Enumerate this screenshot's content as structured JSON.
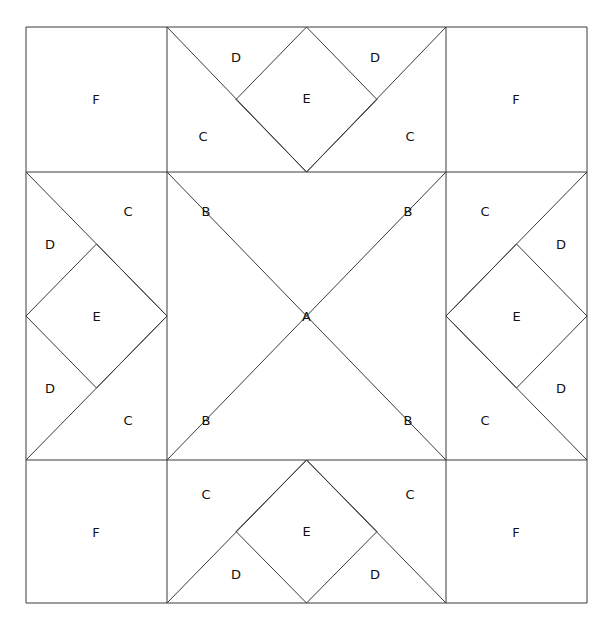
{
  "diagram": {
    "type": "quilt-block-line-diagram",
    "background_color": "#ffffff",
    "line_color": "#3a3a3a",
    "label_color": "#111111",
    "geometry": {
      "outer_left": 26,
      "outer_top": 27,
      "outer_right": 587,
      "outer_bottom": 603,
      "grid_x": [
        26,
        167,
        446,
        587
      ],
      "grid_y": [
        27,
        172,
        460,
        603
      ],
      "center_x": 306.5,
      "center_y": 316,
      "mid_top_y": 99.5,
      "mid_bottom_y": 531.5,
      "mid_left_x": 96.5,
      "mid_right_x": 516.5
    },
    "lines": [
      {
        "name": "outer-border-rect",
        "points": "26,27 587,27 587,603 26,603 26,27"
      },
      {
        "name": "grid-vertical-left",
        "points": "167,27 167,603"
      },
      {
        "name": "grid-vertical-right",
        "points": "446,27 446,603"
      },
      {
        "name": "grid-horizontal-top",
        "points": "26,172 587,172"
      },
      {
        "name": "grid-horizontal-bottom",
        "points": "26,460 587,460"
      },
      {
        "name": "center-diag-nw-se",
        "points": "167,172 446,460"
      },
      {
        "name": "center-diag-ne-sw",
        "points": "446,172 167,460"
      },
      {
        "name": "top-star-left-diag",
        "points": "167,27 306.5,172"
      },
      {
        "name": "top-star-right-diag",
        "points": "446,27 306.5,172"
      },
      {
        "name": "top-diamond-upper-left",
        "points": "236,99.5 306.5,27"
      },
      {
        "name": "top-diamond-upper-right",
        "points": "306.5,27 377,99.5"
      },
      {
        "name": "top-diamond-lower-left",
        "points": "236,99.5 306.5,172"
      },
      {
        "name": "top-diamond-lower-right",
        "points": "306.5,172 377,99.5"
      },
      {
        "name": "bottom-star-left-diag",
        "points": "167,603 306.5,460"
      },
      {
        "name": "bottom-star-right-diag",
        "points": "446,603 306.5,460"
      },
      {
        "name": "bottom-diamond-upper-left",
        "points": "236,531.5 306.5,460"
      },
      {
        "name": "bottom-diamond-upper-right",
        "points": "306.5,460 377,531.5"
      },
      {
        "name": "bottom-diamond-lower-left",
        "points": "236,531.5 306.5,603"
      },
      {
        "name": "bottom-diamond-lower-right",
        "points": "306.5,603 377,531.5"
      },
      {
        "name": "left-star-upper-diag",
        "points": "26,172 167,316"
      },
      {
        "name": "left-star-lower-diag",
        "points": "26,460 167,316"
      },
      {
        "name": "left-diamond-upper-left",
        "points": "26,316 96.5,244"
      },
      {
        "name": "left-diamond-upper-right",
        "points": "96.5,244 167,316"
      },
      {
        "name": "left-diamond-lower-left",
        "points": "26,316 96.5,388"
      },
      {
        "name": "left-diamond-lower-right",
        "points": "96.5,388 167,316"
      },
      {
        "name": "right-star-upper-diag",
        "points": "587,172 446,316"
      },
      {
        "name": "right-star-lower-diag",
        "points": "587,460 446,316"
      },
      {
        "name": "right-diamond-upper-left",
        "points": "446,316 516.5,244"
      },
      {
        "name": "right-diamond-upper-right",
        "points": "516.5,244 587,316"
      },
      {
        "name": "right-diamond-lower-left",
        "points": "446,316 516.5,388"
      },
      {
        "name": "right-diamond-lower-right",
        "points": "516.5,388 587,316"
      }
    ],
    "labels": [
      {
        "name": "label-a-center",
        "text": "A",
        "x": 306.5,
        "y": 317
      },
      {
        "name": "label-b-top-left",
        "text": "B",
        "x": 206,
        "y": 212
      },
      {
        "name": "label-b-top-right",
        "text": "B",
        "x": 408,
        "y": 212
      },
      {
        "name": "label-b-bottom-left",
        "text": "B",
        "x": 206,
        "y": 421
      },
      {
        "name": "label-b-bottom-right",
        "text": "B",
        "x": 408,
        "y": 421
      },
      {
        "name": "label-c-top-left",
        "text": "C",
        "x": 203,
        "y": 137
      },
      {
        "name": "label-c-top-right",
        "text": "C",
        "x": 410,
        "y": 137
      },
      {
        "name": "label-c-left-upper",
        "text": "C",
        "x": 128,
        "y": 212
      },
      {
        "name": "label-c-right-upper",
        "text": "C",
        "x": 485,
        "y": 212
      },
      {
        "name": "label-c-left-lower",
        "text": "C",
        "x": 128,
        "y": 421
      },
      {
        "name": "label-c-right-lower",
        "text": "C",
        "x": 485,
        "y": 421
      },
      {
        "name": "label-c-bottom-left",
        "text": "C",
        "x": 206,
        "y": 495
      },
      {
        "name": "label-c-bottom-right",
        "text": "C",
        "x": 410,
        "y": 495
      },
      {
        "name": "label-d-top-left",
        "text": "D",
        "x": 236,
        "y": 58
      },
      {
        "name": "label-d-top-right",
        "text": "D",
        "x": 375,
        "y": 58
      },
      {
        "name": "label-d-left-upper",
        "text": "D",
        "x": 50,
        "y": 245
      },
      {
        "name": "label-d-right-upper",
        "text": "D",
        "x": 561,
        "y": 245
      },
      {
        "name": "label-d-left-lower",
        "text": "D",
        "x": 50,
        "y": 389
      },
      {
        "name": "label-d-right-lower",
        "text": "D",
        "x": 561,
        "y": 389
      },
      {
        "name": "label-d-bottom-left",
        "text": "D",
        "x": 236,
        "y": 575
      },
      {
        "name": "label-d-bottom-right",
        "text": "D",
        "x": 375,
        "y": 575
      },
      {
        "name": "label-e-top",
        "text": "E",
        "x": 306.5,
        "y": 99
      },
      {
        "name": "label-e-left",
        "text": "E",
        "x": 96.5,
        "y": 317
      },
      {
        "name": "label-e-right",
        "text": "E",
        "x": 516.5,
        "y": 317
      },
      {
        "name": "label-e-bottom",
        "text": "E",
        "x": 306.5,
        "y": 532
      },
      {
        "name": "label-f-top-left",
        "text": "F",
        "x": 96,
        "y": 100
      },
      {
        "name": "label-f-top-right",
        "text": "F",
        "x": 516,
        "y": 100
      },
      {
        "name": "label-f-bottom-left",
        "text": "F",
        "x": 96,
        "y": 533
      },
      {
        "name": "label-f-bottom-right",
        "text": "F",
        "x": 516,
        "y": 533
      }
    ]
  }
}
